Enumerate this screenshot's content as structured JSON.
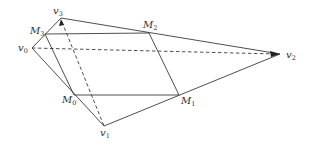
{
  "diagram": {
    "type": "geometric-figure",
    "points": {
      "v0": {
        "name": "v",
        "sub": "0",
        "x": 32,
        "y": 48
      },
      "v1": {
        "name": "v",
        "sub": "1",
        "x": 104,
        "y": 126
      },
      "v2": {
        "name": "v",
        "sub": "2",
        "x": 280,
        "y": 54
      },
      "v3": {
        "name": "v",
        "sub": "3",
        "x": 61,
        "y": 18
      },
      "M0": {
        "name": "M",
        "sub": "0",
        "x": 74,
        "y": 95
      },
      "M1": {
        "name": "M",
        "sub": "1",
        "x": 179,
        "y": 95
      },
      "M2": {
        "name": "M",
        "sub": "2",
        "x": 149,
        "y": 33
      },
      "M3": {
        "name": "M",
        "sub": "3",
        "x": 45,
        "y": 34
      }
    },
    "solid_edges": [
      [
        "v0",
        "v3"
      ],
      [
        "v3",
        "v2"
      ],
      [
        "v0",
        "v1"
      ],
      [
        "v1",
        "v2"
      ],
      [
        "M3",
        "M2"
      ],
      [
        "M2",
        "M1"
      ],
      [
        "M1",
        "M0"
      ],
      [
        "M0",
        "M3"
      ]
    ],
    "dashed_edges": [
      [
        "v0",
        "v2"
      ],
      [
        "v3",
        "v1"
      ]
    ]
  }
}
